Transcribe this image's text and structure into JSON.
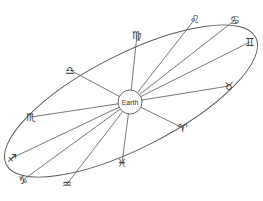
{
  "diagram": {
    "center_label": "Earth",
    "colors": {
      "line": "#555555",
      "glyph": "#333333",
      "background": "#ffffff"
    },
    "earth": {
      "cx": 130,
      "cy": 102,
      "r": 12
    },
    "orbit": {
      "cx": 131,
      "cy": 101,
      "rx": 140,
      "ry": 47,
      "rotation": -27
    },
    "signs": [
      {
        "name": "Leo",
        "symbol": "♌",
        "x": 195,
        "y": 19
      },
      {
        "name": "Cancer",
        "symbol": "♋",
        "x": 235,
        "y": 20
      },
      {
        "name": "Gemini",
        "symbol": "♊",
        "x": 250,
        "y": 42
      },
      {
        "name": "Taurus",
        "symbol": "♉",
        "x": 229,
        "y": 86
      },
      {
        "name": "Aries",
        "symbol": "♈",
        "x": 183,
        "y": 128
      },
      {
        "name": "Pisces",
        "symbol": "♓",
        "x": 122,
        "y": 163
      },
      {
        "name": "Aquarius",
        "symbol": "♒",
        "x": 67,
        "y": 184
      },
      {
        "name": "Capricorn",
        "symbol": "♑",
        "x": 23,
        "y": 180
      },
      {
        "name": "Sagittarius",
        "symbol": "♐",
        "x": 12,
        "y": 158
      },
      {
        "name": "Scorpio",
        "symbol": "♏",
        "x": 31,
        "y": 117
      },
      {
        "name": "Libra",
        "symbol": "♎",
        "x": 70,
        "y": 70
      },
      {
        "name": "Virgo",
        "symbol": "♍",
        "x": 137,
        "y": 35
      }
    ]
  }
}
